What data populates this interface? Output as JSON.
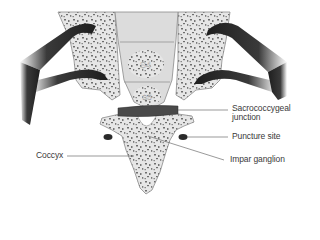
{
  "figure": {
    "vertebrae": [
      {
        "id": "s4",
        "label": "S4"
      },
      {
        "id": "s5",
        "label": "S5"
      }
    ],
    "labels": {
      "sacrococcygeal_line1": "Sacrococcygeal",
      "sacrococcygeal_line2": "junction",
      "puncture_site": "Puncture site",
      "coccyx": "Coccyx",
      "impar_ganglion": "Impar ganglion"
    },
    "colors": {
      "bone_fill": "#e6e6e6",
      "bone_outline": "#8a8a8a",
      "bone_speckle": "#6e6e6e",
      "nerve": "#2a2a2a",
      "junction_band": "#4a4a4a",
      "leader_line": "#555555",
      "text": "#3a3a3a"
    }
  }
}
